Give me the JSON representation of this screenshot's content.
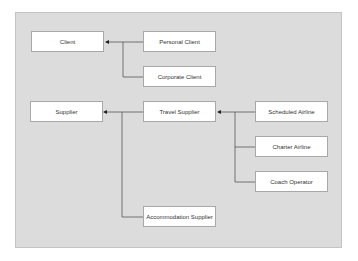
{
  "diagram": {
    "type": "class-hierarchy",
    "nodes": {
      "client": "Client",
      "personal_client": "Personal Client",
      "corporate_client": "Corporate Client",
      "supplier": "Supplier",
      "travel_supplier": "Travel Supplier",
      "scheduled_airline": "Scheduled Airline",
      "charter_airline": "Charter Airline",
      "coach_operator": "Coach Operator",
      "accommodation_supplier": "Accommodation Supplier"
    },
    "edges": [
      {
        "from": "Personal Client",
        "to": "Client"
      },
      {
        "from": "Corporate Client",
        "to": "Client"
      },
      {
        "from": "Travel Supplier",
        "to": "Supplier"
      },
      {
        "from": "Accommodation Supplier",
        "to": "Supplier"
      },
      {
        "from": "Scheduled Airline",
        "to": "Travel Supplier"
      },
      {
        "from": "Charter Airline",
        "to": "Travel Supplier"
      },
      {
        "from": "Coach Operator",
        "to": "Travel Supplier"
      }
    ]
  }
}
